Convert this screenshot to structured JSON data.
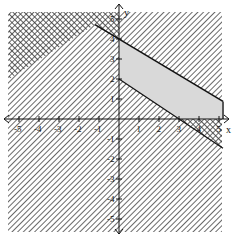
{
  "chart_data": {
    "type": "area",
    "title": "",
    "xlabel": "x",
    "ylabel": "y",
    "xlim": [
      -5.5,
      5.2
    ],
    "ylim": [
      -5.5,
      5.5
    ],
    "grid": false,
    "x_ticks": [
      -5,
      -4,
      -3,
      -2,
      -1,
      1,
      2,
      3,
      4,
      5
    ],
    "y_ticks": [
      -5,
      -4,
      -3,
      -2,
      -1,
      1,
      2,
      3,
      4,
      5
    ],
    "x_tick_labels": [
      "-5",
      "-4",
      "-3",
      "-2",
      "-1",
      "1",
      "2",
      "3",
      "4",
      "5"
    ],
    "y_tick_labels": [
      "-5",
      "-4",
      "-3",
      "-2",
      "-1",
      "1",
      "2",
      "3",
      "4",
      "5"
    ],
    "boundary_lines": [
      {
        "name": "upper",
        "equation": "3x + 5y = 20",
        "points": [
          [
            0,
            4
          ],
          [
            5.2,
            0.88
          ]
        ]
      },
      {
        "name": "lower",
        "equation": "2x + 3y = 6",
        "points": [
          [
            0,
            2
          ],
          [
            3,
            0
          ]
        ]
      }
    ],
    "feasible_region": {
      "description": "Unshaded (light gray) region: x >= 0, y >= 0, 2x + 3y >= 6, 3x + 5y <= 20",
      "vertices": [
        [
          0,
          2
        ],
        [
          0,
          4
        ],
        [
          5.2,
          0.88
        ],
        [
          5.2,
          0
        ],
        [
          3,
          0
        ]
      ],
      "fill": "#d9d9d9"
    },
    "shading": {
      "style": "diagonal hatching over non-feasible half-planes; double-hatched (crosshatch) where two excluded regions overlap",
      "hatch_color": "#333333"
    }
  },
  "axes": {
    "x_label": "x",
    "y_label": "y"
  }
}
